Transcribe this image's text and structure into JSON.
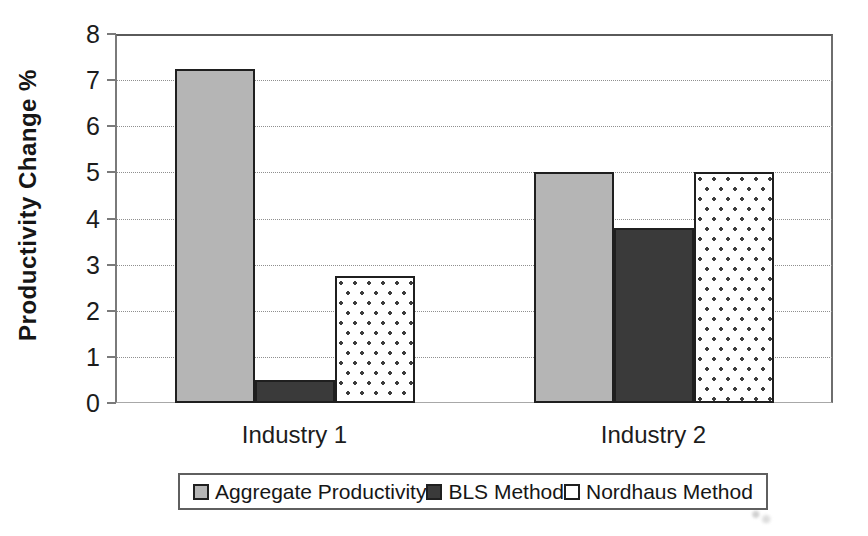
{
  "chart_data": {
    "type": "bar",
    "title": "",
    "xlabel": "",
    "ylabel": "Productivity Change %",
    "categories": [
      "Industry 1",
      "Industry 2"
    ],
    "series": [
      {
        "name": "Aggregate Productivity",
        "values": [
          7.25,
          5.0
        ],
        "fill": "#b5b5b5",
        "pattern": "solid"
      },
      {
        "name": "BLS Method",
        "values": [
          0.5,
          3.8
        ],
        "fill": "#3a3a3a",
        "pattern": "solid"
      },
      {
        "name": "Nordhaus Method",
        "values": [
          2.75,
          5.0
        ],
        "fill": "#ffffff",
        "pattern": "dots"
      }
    ],
    "ylim": [
      0,
      8
    ],
    "yticks": [
      0,
      1,
      2,
      3,
      4,
      5,
      6,
      7,
      8
    ],
    "grid": true,
    "legend_position": "bottom"
  },
  "colors": {
    "bar_border": "#1f1f1f",
    "aggregate_fill": "#b5b5b5",
    "bls_fill": "#3a3a3a",
    "nordhaus_fill": "#ffffff",
    "gridline": "#8f8f8f",
    "axis": "#6e6e6e",
    "text": "#1c1c1c",
    "background": "#ffffff"
  }
}
